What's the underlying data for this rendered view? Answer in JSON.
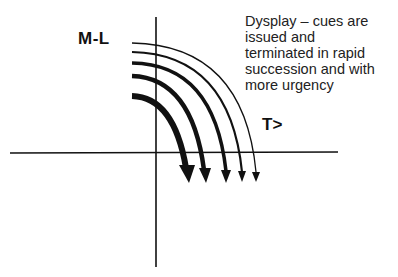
{
  "diagram": {
    "y_axis_label": "M-L",
    "x_axis_label": "T>",
    "description_lines": [
      "Dysplay – cues are",
      "issued and",
      "terminated in rapid",
      "succession and with",
      "more urgency"
    ],
    "arrows": [
      {
        "start_y": 95,
        "end_x": 189,
        "stroke_width": 6
      },
      {
        "start_y": 76,
        "end_x": 206,
        "stroke_width": 4.5
      },
      {
        "start_y": 63,
        "end_x": 226,
        "stroke_width": 3.5
      },
      {
        "start_y": 52,
        "end_x": 242,
        "stroke_width": 2.2
      },
      {
        "start_y": 43,
        "end_x": 256,
        "stroke_width": 1.3
      }
    ],
    "colors": {
      "line": "#111111",
      "background": "#ffffff"
    }
  }
}
